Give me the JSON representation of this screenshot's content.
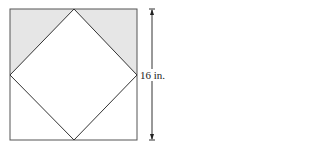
{
  "diagram": {
    "dimension_label": "16 in.",
    "colors": {
      "stroke": "#444444",
      "shade": "#e6e6e6",
      "background": "#ffffff"
    },
    "shapes": {
      "outer_square": "square",
      "inner_square": "rotated square connecting midpoints",
      "shaded_regions": [
        "top-left triangle",
        "top-right triangle"
      ]
    }
  }
}
